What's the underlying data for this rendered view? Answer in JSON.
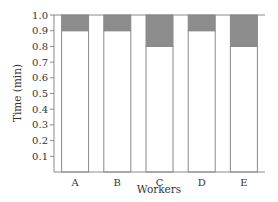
{
  "chart_data": {
    "type": "bar",
    "stacked": true,
    "title": "",
    "xlabel": "Workers",
    "ylabel": "Time (min)",
    "categories": [
      "A",
      "B",
      "C",
      "D",
      "E"
    ],
    "series": [
      {
        "name": "lower segment",
        "color": "#ffffff",
        "values": [
          0.9,
          0.9,
          0.8,
          0.9,
          0.8
        ]
      },
      {
        "name": "upper segment",
        "color": "#8c8c8c",
        "values": [
          0.1,
          0.1,
          0.2,
          0.1,
          0.2
        ]
      }
    ],
    "yticks": [
      "0.1",
      "0.2",
      "0.3",
      "0.4",
      "0.5",
      "0.6",
      "0.7",
      "0.8",
      "0.9",
      "1.0"
    ],
    "ylim": [
      0,
      1.0
    ],
    "grid": false,
    "legend": "none"
  },
  "colors": {
    "axis": "#8a8a8a",
    "bar_outline": "#8a8a8a",
    "shaded": "#8c8c8c",
    "text": "#333333"
  }
}
